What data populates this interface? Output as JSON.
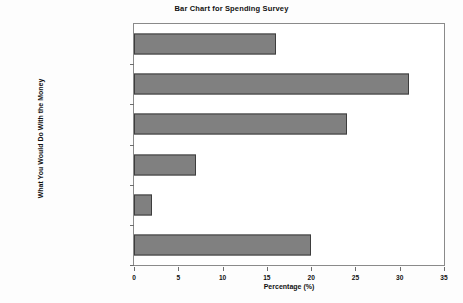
{
  "chart_data": {
    "type": "bar",
    "orientation": "horizontal",
    "title": "Bar Chart for Spending Survey",
    "xlabel": "Percentage (%)",
    "ylabel": "What You Would Do With the Money",
    "categories": [
      "Spend on essentials",
      "Save",
      "Pay debt",
      "Other",
      "Give it to charity",
      "Buy a luxury item, vacation, or gift"
    ],
    "category_lines": [
      [
        "Spend on essentials"
      ],
      [
        "Save"
      ],
      [
        "Pay debt"
      ],
      [
        "Other"
      ],
      [
        "Give it to charity"
      ],
      [
        "Buy a luxury item, vacation,",
        "or gift"
      ]
    ],
    "values": [
      16,
      31,
      24,
      7,
      2,
      20
    ],
    "xlim": [
      0,
      35
    ],
    "xticks": [
      0,
      5,
      10,
      15,
      20,
      25,
      30,
      35
    ],
    "xtick_labels": [
      "0",
      "5",
      "10",
      "15",
      "20",
      "25",
      "30",
      "35"
    ],
    "grid": false,
    "legend": false,
    "bar_color": "#808080",
    "bar_edge_color": "#3d3d3d",
    "axis_color": "#8a8a8a",
    "background_color": "#ffffff"
  }
}
